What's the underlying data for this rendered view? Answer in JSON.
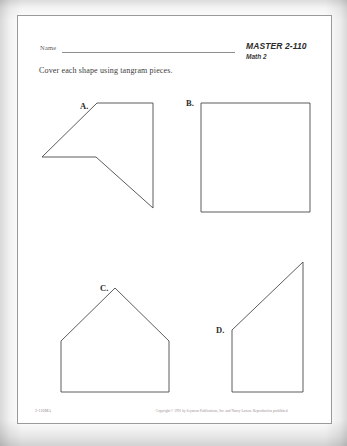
{
  "page": {
    "name_label": "Name",
    "master_id": "MASTER 2-110",
    "master_sub": "Math 2",
    "instruction": "Cover each shape using tangram pieces."
  },
  "shapes": [
    {
      "label": "A.",
      "kind": "concave-arrow-polygon",
      "label_x": 80,
      "label_y": 101,
      "points": "97,103 153,103 153,208 96,157 42,157"
    },
    {
      "label": "B.",
      "kind": "square",
      "label_x": 186,
      "label_y": 98,
      "points": "201,103 310,103 310,212 201,212"
    },
    {
      "label": "C.",
      "kind": "house-pentagon",
      "label_x": 100,
      "label_y": 283,
      "points": "115,288 169,341 169,392 61,392 61,341"
    },
    {
      "label": "D.",
      "kind": "right-trapezoid",
      "label_x": 216,
      "label_y": 325,
      "points": "232,330 303,262 303,392 232,392"
    }
  ],
  "footer": {
    "code": "2-110MA",
    "copyright": "Copyright © 1991 by Seymour Publications, Inc. and Nancy Larson. Reproduction prohibited."
  }
}
